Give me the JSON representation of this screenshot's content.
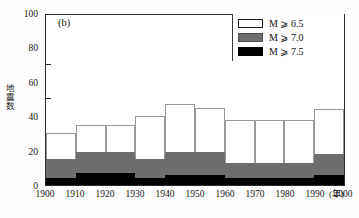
{
  "panel": {
    "label": "(b)"
  },
  "legend": {
    "items": [
      {
        "name": "m-ge-6-5",
        "label": "M ⩾ 6.5",
        "color": "#ffffff"
      },
      {
        "name": "m-ge-7-0",
        "label": "M ⩾ 7.0",
        "color": "#6e6e6e"
      },
      {
        "name": "m-ge-7-5",
        "label": "M ⩾ 7.5",
        "color": "#000000"
      }
    ]
  },
  "axes": {
    "y_title": "地震数",
    "y_ticks": [
      "0",
      "20",
      "40",
      "60",
      "80",
      "100"
    ],
    "x_ticks": [
      "1900",
      "1910",
      "1920",
      "1930",
      "1940",
      "1950",
      "1960",
      "1970",
      "1980",
      "1990",
      "2000"
    ],
    "x_unit": "(年)"
  },
  "chart_data": {
    "type": "bar",
    "title": "(b)",
    "subtitle": "",
    "xlabel": "(年)",
    "ylabel": "地震数",
    "ylim": [
      0,
      100
    ],
    "xlim": [
      1900,
      2000
    ],
    "grid": false,
    "legend_position": "top-right",
    "stacked": true,
    "categories": [
      "1900-1910",
      "1910-1920",
      "1920-1930",
      "1930-1940",
      "1940-1950",
      "1950-1960",
      "1960-1970",
      "1970-1980",
      "1980-1990",
      "1990-2000"
    ],
    "tick_labels": [
      "1900",
      "1910",
      "1920",
      "1930",
      "1940",
      "1950",
      "1960",
      "1970",
      "1980",
      "1990",
      "2000"
    ],
    "series": [
      {
        "name": "M ⩾ 6.5",
        "color": "#ffffff",
        "values": [
          30,
          35,
          35,
          40,
          47,
          45,
          38,
          38,
          38,
          44
        ]
      },
      {
        "name": "M ⩾ 7.0",
        "color": "#6e6e6e",
        "values": [
          15,
          19,
          19,
          15,
          19,
          19,
          13,
          13,
          13,
          18
        ]
      },
      {
        "name": "M ⩾ 7.5",
        "color": "#000000",
        "values": [
          4,
          7,
          7,
          4,
          6,
          6,
          4,
          4,
          4,
          6
        ]
      }
    ]
  }
}
